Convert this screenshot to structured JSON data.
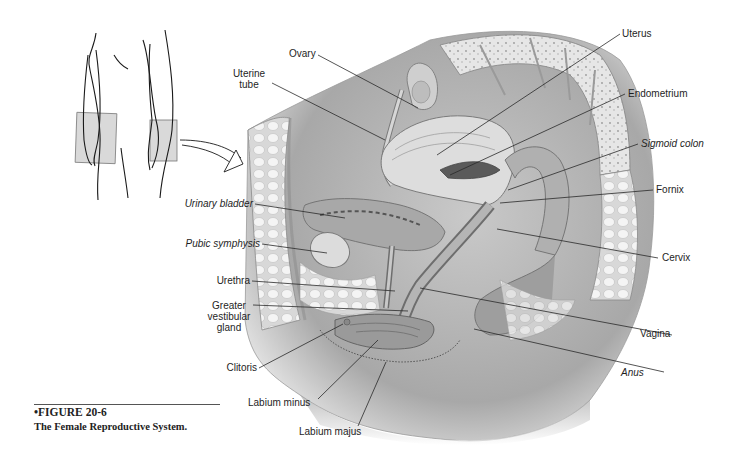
{
  "figure": {
    "number": "•FIGURE 20-6",
    "title": "The Female Reproductive System."
  },
  "labels": {
    "ovary": "Ovary",
    "uterine_tube_line1": "Uterine",
    "uterine_tube_line2": "tube",
    "uterus": "Uterus",
    "endometrium": "Endometrium",
    "sigmoid_colon": "Sigmoid colon",
    "fornix": "Fornix",
    "cervix": "Cervix",
    "urinary_bladder": "Urinary bladder",
    "pubic_symphysis": "Pubic symphysis",
    "urethra": "Urethra",
    "greater_vestibular_gland_line1": "Greater",
    "greater_vestibular_gland_line2": "vestibular",
    "greater_vestibular_gland_line3": "gland",
    "clitoris": "Clitoris",
    "labium_minus": "Labium minus",
    "labium_majus": "Labium majus",
    "vagina": "Vagina",
    "anus": "Anus"
  },
  "colors": {
    "line": "#2a2a2a",
    "tissue_dark": "#8c8c8c",
    "tissue_mid": "#b9b9b9",
    "tissue_light": "#dcdcdc",
    "background": "#ffffff"
  }
}
